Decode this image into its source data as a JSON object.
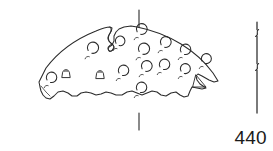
{
  "figure": {
    "kind": "archaeological-line-drawing",
    "catalog_number": "440",
    "ink_color": "#2a2a2a",
    "fill_color": "#ffffff",
    "background_color": "#ffffff",
    "width_px": 273,
    "height_px": 151
  },
  "sherd": {
    "outline_path": "M 39 82 L 46 68 C 58 52 76 39 96 31 C 103 28 108 27 110 27 L 112 28 C 112 31 110 33 109 35 C 108 37 108 39 109 41 C 110 43 112 44 113 45 C 114 46 114 48 113 49 C 112 51 110 52 109 51 C 108 50 108 48 109 47 L 112 45 L 114 41 L 114 36 L 116 32 L 119 29 L 124 27 L 131 26 L 137 27 C 152 30 168 36 181 44 C 194 52 205 62 213 73 L 218 81 L 214 82 L 209 80 L 202 76 L 198 74 L 196 76 L 197 80 L 200 84 L 203 86 L 206 88 L 202 89 L 197 88 L 192 87 L 190 91 L 188 96 L 184 97 L 180 95 L 176 92 L 171 93 L 166 96 L 161 95 L 157 92 L 152 91 L 147 93 L 142 95 L 137 93 L 132 91 L 127 92 L 122 95 L 116 95 L 111 93 L 106 92 L 101 94 L 96 95 L 91 93 L 86 92 L 81 93 L 77 96 L 72 96 L 68 93 L 63 91 L 58 92 L 54 96 L 50 99 L 46 98 L 43 95 L 41 91 L 40 87 Z",
    "top_notch_path": "M 110 27 C 112 29 111 32 109 35 C 107 38 108 41 111 43 C 114 45 115 48 113 50 C 111 52 108 51 108 48 C 108 46 110 45 112 44",
    "right_break_path": "M 196 75 L 206 87 L 193 87 Z",
    "inner_edge_path": "M 41 86 L 46 92 L 50 96",
    "bosses": [
      {
        "cx": 46,
        "cy": 85,
        "r": 5.2,
        "style": "c-open-right"
      },
      {
        "cx": 66,
        "cy": 73,
        "r": 5.4,
        "style": "dome"
      },
      {
        "cx": 87,
        "cy": 56,
        "r": 5.6,
        "style": "c-open-right"
      },
      {
        "cx": 100,
        "cy": 74,
        "r": 5.4,
        "style": "dome"
      },
      {
        "cx": 118,
        "cy": 78,
        "r": 5.2,
        "style": "c-open-right"
      },
      {
        "cx": 115,
        "cy": 48,
        "r": 4.8,
        "style": "c-open-right"
      },
      {
        "cx": 136,
        "cy": 37,
        "r": 5.4,
        "style": "c-open-right"
      },
      {
        "cx": 138,
        "cy": 57,
        "r": 5.6,
        "style": "c-open-right"
      },
      {
        "cx": 141,
        "cy": 74,
        "r": 5.4,
        "style": "c-open-right"
      },
      {
        "cx": 136,
        "cy": 95,
        "r": 5.2,
        "style": "c-open-right"
      },
      {
        "cx": 159,
        "cy": 72,
        "r": 5.2,
        "style": "c-open-right"
      },
      {
        "cx": 160,
        "cy": 50,
        "r": 5.4,
        "style": "c-open-right"
      },
      {
        "cx": 180,
        "cy": 57,
        "r": 5.2,
        "style": "c-open-right"
      },
      {
        "cx": 180,
        "cy": 76,
        "r": 5.0,
        "style": "c-open-right"
      },
      {
        "cx": 201,
        "cy": 66,
        "r": 5.0,
        "style": "c-open-right"
      }
    ]
  },
  "axis_marker": {
    "label": "vertical centre axis",
    "x": 139,
    "top_segment": {
      "y1": 10,
      "y2": 27
    },
    "bottom_segment": {
      "y1": 113,
      "y2": 130
    }
  },
  "scale_bar": {
    "label": "vertical scale bar",
    "x": 257,
    "y_top": 22,
    "y_bottom": 113,
    "break_marks": [
      {
        "y": 33
      },
      {
        "y": 67
      }
    ]
  }
}
